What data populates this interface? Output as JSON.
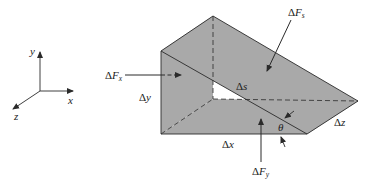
{
  "diagram": {
    "colors": {
      "background": "#ffffff",
      "wedge_fill": "#a9a9a9",
      "line": "#2a2a2a"
    },
    "axes": {
      "x_label": "x",
      "y_label": "y",
      "z_label": "z"
    },
    "forces": {
      "Fx": {
        "delta": "Δ",
        "symbol": "F",
        "sub": "x"
      },
      "Fy": {
        "delta": "Δ",
        "symbol": "F",
        "sub": "y"
      },
      "Fs": {
        "delta": "Δ",
        "symbol": "F",
        "sub": "s"
      }
    },
    "dimensions": {
      "dx": "Δx",
      "dy": "Δy",
      "dz": "Δz",
      "ds": "Δs"
    },
    "angle_label": "θ"
  }
}
